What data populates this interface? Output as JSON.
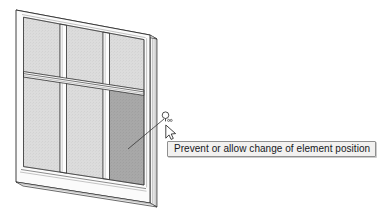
{
  "app": {
    "canvas_background": "#ffffff",
    "view_name": "3d-isometric-view"
  },
  "tooltip": {
    "text": "Prevent or allow change of element position",
    "background": "#f2f1f0",
    "border_color": "#8f8f8f",
    "text_color": "#16181c"
  },
  "pin_badge": {
    "label": "",
    "icon": "pin-icon"
  },
  "cursor": {
    "icon": "arrow-cursor-icon"
  },
  "model": {
    "name": "curtain-wall",
    "grid_columns": 3,
    "grid_rows": 2,
    "frame_color": "#ffffff",
    "frame_outline_color": "#2b2b2b",
    "panel_color": "#d9d9d9",
    "panel_selected_color": "#a6a6a6",
    "mullion_shadow_color": "#4a4a4a",
    "edge_color": "#1f1f1f",
    "panels": [
      {
        "id": "panel-r1-c1",
        "state": "normal"
      },
      {
        "id": "panel-r1-c2",
        "state": "normal"
      },
      {
        "id": "panel-r1-c3",
        "state": "normal"
      },
      {
        "id": "panel-r2-c1",
        "state": "normal"
      },
      {
        "id": "panel-r2-c2",
        "state": "normal"
      },
      {
        "id": "panel-r2-c3",
        "state": "selected"
      }
    ],
    "leader_line": {
      "from_x": 128,
      "from_y": 149,
      "to_x": 165,
      "to_y": 119
    }
  }
}
